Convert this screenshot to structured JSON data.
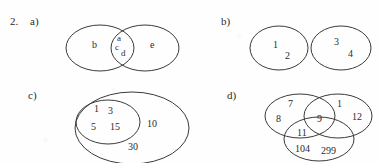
{
  "item": {
    "number": "2."
  },
  "parts": {
    "a": {
      "label": "a)",
      "type": "two-overlapping-ellipses",
      "regions": [
        {
          "name": "left-only",
          "elements": [
            "b"
          ]
        },
        {
          "name": "intersection",
          "elements": [
            "a",
            "c",
            "d"
          ]
        },
        {
          "name": "right-only",
          "elements": [
            "e"
          ]
        }
      ],
      "elements": {
        "b": "b",
        "a": "a",
        "c": "c",
        "d": "d",
        "e": "e"
      }
    },
    "b": {
      "label": "b)",
      "type": "two-disjoint-ellipses",
      "regions": [
        {
          "name": "left",
          "elements": [
            "1",
            "2"
          ]
        },
        {
          "name": "right",
          "elements": [
            "3",
            "4"
          ]
        }
      ],
      "elements": {
        "one": "1",
        "two": "2",
        "three": "3",
        "four": "4"
      }
    },
    "c": {
      "label": "c)",
      "type": "nested-ellipses",
      "regions": [
        {
          "name": "inner",
          "elements": [
            "1",
            "3",
            "5",
            "15"
          ]
        },
        {
          "name": "outer-ring",
          "elements": [
            "10",
            "30"
          ]
        }
      ],
      "elements": {
        "one": "1",
        "three": "3",
        "five": "5",
        "fifteen": "15",
        "ten": "10",
        "thirty": "30"
      }
    },
    "d": {
      "label": "d)",
      "type": "three-circle-venn",
      "regions": [
        {
          "name": "top-left-only",
          "elements": [
            "7",
            "8"
          ]
        },
        {
          "name": "top-right-only",
          "elements": [
            "1",
            "12"
          ]
        },
        {
          "name": "center-all-three",
          "elements": [
            "9"
          ]
        },
        {
          "name": "left-bottom-overlap",
          "elements": [
            "11"
          ]
        },
        {
          "name": "bottom-only",
          "elements": [
            "104",
            "299"
          ]
        }
      ],
      "elements": {
        "seven": "7",
        "eight": "8",
        "one": "1",
        "twelve": "12",
        "nine": "9",
        "eleven": "11",
        "onezerofour": "104",
        "twoninenine": "299"
      }
    }
  },
  "colors": {
    "ink": "#2b2b2b",
    "stroke": "#3a3a3a",
    "paper": "#fefefe"
  }
}
